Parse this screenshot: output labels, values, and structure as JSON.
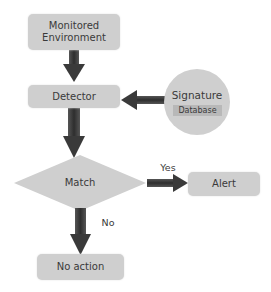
{
  "diagram": {
    "type": "flowchart",
    "nodes": [
      {
        "id": "monitored",
        "shape": "rounded-rect",
        "line1": "Monitored",
        "line2": "Environment"
      },
      {
        "id": "detector",
        "shape": "rounded-rect",
        "label": "Detector"
      },
      {
        "id": "signature",
        "shape": "circle",
        "label": "Signature",
        "sublabel": "Database"
      },
      {
        "id": "match",
        "shape": "diamond",
        "label": "Match"
      },
      {
        "id": "alert",
        "shape": "rounded-rect",
        "label": "Alert"
      },
      {
        "id": "no_action",
        "shape": "rounded-rect",
        "label": "No action"
      }
    ],
    "edges": [
      {
        "from": "monitored",
        "to": "detector",
        "label": ""
      },
      {
        "from": "signature",
        "to": "detector",
        "label": ""
      },
      {
        "from": "detector",
        "to": "match",
        "label": ""
      },
      {
        "from": "match",
        "to": "alert",
        "label": "Yes"
      },
      {
        "from": "match",
        "to": "no_action",
        "label": "No"
      }
    ],
    "edge_labels": {
      "yes": "Yes",
      "no": "No"
    },
    "colors": {
      "node_fill": "#cfcfcf",
      "database_label_fill": "#b8b8b8",
      "arrow": "#3f3f3f",
      "text": "#3a3a3a"
    }
  }
}
